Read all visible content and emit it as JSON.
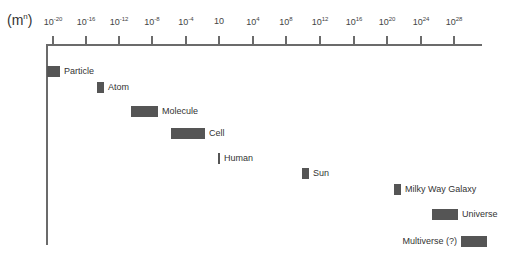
{
  "chart_data": {
    "type": "range-bar",
    "title": "",
    "unit_label_base": "(m",
    "unit_label_exp": "n",
    "unit_label_close": ")",
    "x_axis": {
      "scale": "log10",
      "ticks": [
        {
          "base": "10",
          "exp": "-20",
          "x": 53
        },
        {
          "base": "10",
          "exp": "-16",
          "x": 86
        },
        {
          "base": "10",
          "exp": "-12",
          "x": 119
        },
        {
          "base": "10",
          "exp": "-8",
          "x": 152
        },
        {
          "base": "10",
          "exp": "-4",
          "x": 186
        },
        {
          "base": "10",
          "exp": "",
          "x": 219
        },
        {
          "base": "10",
          "exp": "4",
          "x": 253
        },
        {
          "base": "10",
          "exp": "8",
          "x": 286
        },
        {
          "base": "10",
          "exp": "12",
          "x": 320
        },
        {
          "base": "10",
          "exp": "16",
          "x": 354
        },
        {
          "base": "10",
          "exp": "20",
          "x": 387
        },
        {
          "base": "10",
          "exp": "24",
          "x": 421
        },
        {
          "base": "10",
          "exp": "28",
          "x": 454
        }
      ]
    },
    "items": [
      {
        "label": "Particle",
        "min_exp": -21,
        "max_exp": -19.5,
        "x": 47,
        "w": 13,
        "y": 66,
        "label_side": "right"
      },
      {
        "label": "Atom",
        "min_exp": -15,
        "max_exp": -14,
        "x": 97,
        "w": 7,
        "y": 82,
        "label_side": "right"
      },
      {
        "label": "Molecule",
        "min_exp": -10,
        "max_exp": -7,
        "x": 131,
        "w": 27,
        "y": 106,
        "label_side": "right"
      },
      {
        "label": "Cell",
        "min_exp": -6,
        "max_exp": -2,
        "x": 171,
        "w": 34,
        "y": 128,
        "label_side": "right"
      },
      {
        "label": "Human",
        "min_exp": 0,
        "max_exp": 0.3,
        "x": 218,
        "w": 2,
        "y": 153,
        "label_side": "right"
      },
      {
        "label": "Sun",
        "min_exp": 9,
        "max_exp": 10,
        "x": 302,
        "w": 7,
        "y": 168,
        "label_side": "right"
      },
      {
        "label": "Milky Way Galaxy",
        "min_exp": 21,
        "max_exp": 21.5,
        "x": 394,
        "w": 7,
        "y": 184,
        "label_side": "right"
      },
      {
        "label": "Universe",
        "min_exp": 25,
        "max_exp": 28,
        "x": 432,
        "w": 26,
        "y": 209,
        "label_side": "right"
      },
      {
        "label": "Multiverse (?)",
        "min_exp": 29,
        "max_exp": 32,
        "x": 461,
        "w": 26,
        "y": 236,
        "label_side": "left"
      }
    ],
    "bar_color": "#555555",
    "axis_color": "#6b6b6b"
  }
}
